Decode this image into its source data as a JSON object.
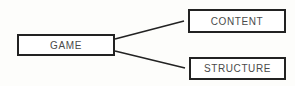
{
  "diagram": {
    "type": "tree",
    "nodes": [
      {
        "id": "game",
        "label": "GAME"
      },
      {
        "id": "content",
        "label": "CONTENT"
      },
      {
        "id": "structure",
        "label": "STRUCTURE"
      }
    ],
    "edges": [
      {
        "from": "game",
        "to": "content"
      },
      {
        "from": "game",
        "to": "structure"
      }
    ],
    "colors": {
      "border": "#222222",
      "text": "#4a4a4a",
      "background": "#fdfdfb"
    }
  }
}
